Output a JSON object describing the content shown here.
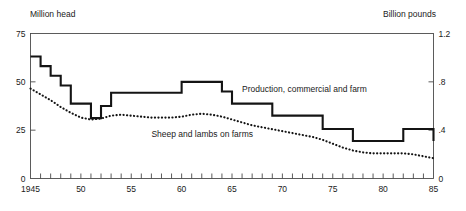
{
  "chart_data": {
    "type": "line",
    "title": "",
    "xlabel": "",
    "ylabel": "Million head",
    "y2label": "Billion pounds",
    "grid": false,
    "legend_position": "inline-annotation",
    "xlim": [
      1945,
      1985
    ],
    "ylim": [
      0,
      75
    ],
    "y2lim": [
      0,
      1.2
    ],
    "yticks": [
      "0",
      "25",
      "50",
      "75"
    ],
    "ytick_values": [
      0,
      25,
      50,
      75
    ],
    "y2ticks": [
      "0",
      ".4",
      ".8",
      "1.2"
    ],
    "y2tick_values": [
      0,
      0.4,
      0.8,
      1.2
    ],
    "xticks": [
      "1945",
      "50",
      "55",
      "60",
      "65",
      "70",
      "75",
      "80",
      "85"
    ],
    "xtick_values": [
      1945,
      1950,
      1955,
      1960,
      1965,
      1970,
      1975,
      1980,
      1985
    ],
    "xtick_minor_step": 1,
    "x": [
      1945,
      1946,
      1947,
      1948,
      1949,
      1950,
      1951,
      1952,
      1953,
      1954,
      1955,
      1956,
      1957,
      1958,
      1959,
      1960,
      1961,
      1962,
      1963,
      1964,
      1965,
      1966,
      1967,
      1968,
      1969,
      1970,
      1971,
      1972,
      1973,
      1974,
      1975,
      1976,
      1977,
      1978,
      1979,
      1980,
      1981,
      1982,
      1983,
      1984,
      1985
    ],
    "series": [
      {
        "name": "Production, commercial and farm",
        "axis": "right",
        "units": "Billion pounds",
        "style": "solid",
        "label_anchor_year": 1966,
        "label_anchor_value": 0.72,
        "values": [
          1.01,
          0.93,
          0.85,
          0.77,
          0.62,
          0.62,
          0.5,
          0.6,
          0.71,
          0.71,
          0.71,
          0.71,
          0.71,
          0.71,
          0.71,
          0.8,
          0.8,
          0.8,
          0.8,
          0.72,
          0.62,
          0.62,
          0.62,
          0.62,
          0.52,
          0.52,
          0.52,
          0.52,
          0.52,
          0.41,
          0.41,
          0.41,
          0.31,
          0.31,
          0.31,
          0.31,
          0.31,
          0.41,
          0.41,
          0.41,
          0.31
        ]
      },
      {
        "name": "Sheep and lambs on farms",
        "axis": "left",
        "units": "Million head",
        "style": "dotted",
        "label_anchor_year": 1957,
        "label_anchor_value": 21.5,
        "values": [
          46.5,
          43.5,
          40.5,
          37.0,
          34.0,
          31.5,
          30.5,
          31.0,
          32.5,
          33.0,
          32.5,
          32.0,
          31.5,
          31.5,
          31.5,
          32.0,
          33.0,
          33.5,
          33.0,
          32.0,
          30.5,
          29.0,
          27.5,
          26.5,
          25.5,
          24.5,
          23.5,
          22.5,
          21.5,
          20.0,
          18.0,
          16.0,
          14.5,
          13.5,
          13.0,
          13.0,
          13.0,
          13.0,
          12.5,
          11.5,
          10.5
        ]
      }
    ]
  },
  "labels": {
    "left_axis_unit": "Million head",
    "right_axis_unit": "Billion pounds",
    "series_production": "Production, commercial and farm",
    "series_sheep": "Sheep and lambs on farms"
  }
}
